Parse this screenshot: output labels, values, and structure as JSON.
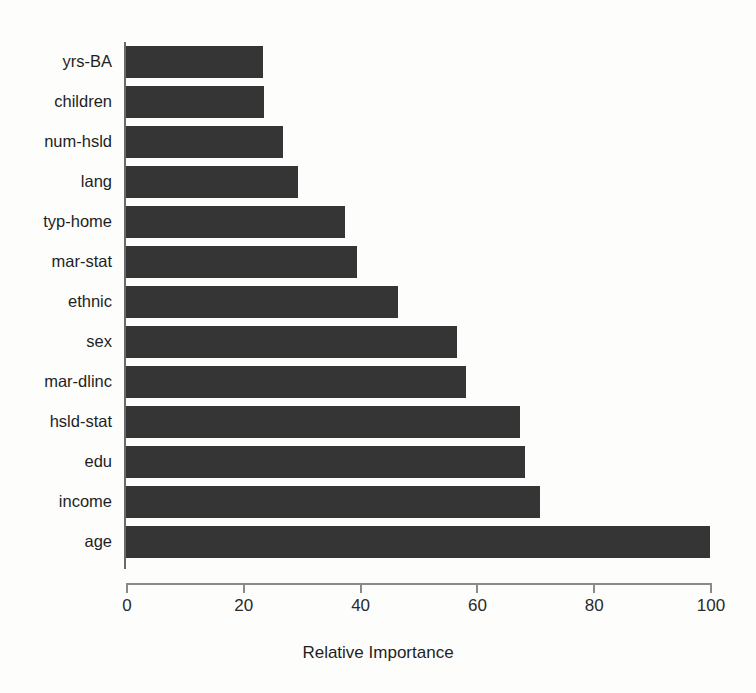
{
  "chart_data": {
    "type": "bar",
    "orientation": "horizontal",
    "title": "",
    "xlabel": "Relative Importance",
    "ylabel": "",
    "xlim": [
      0,
      100
    ],
    "xticks": [
      0,
      20,
      40,
      60,
      80,
      100
    ],
    "xtick_labels": [
      "0",
      "20",
      "40",
      "60",
      "80",
      "100"
    ],
    "grid": false,
    "legend": null,
    "bar_color": "#353535",
    "background_color": "#fdfdfc",
    "axis_color": "#8a8a8a",
    "categories": [
      "yrs-BA",
      "children",
      "num-hsld",
      "lang",
      "typ-home",
      "mar-stat",
      "ethnic",
      "sex",
      "mar-dlinc",
      "hsld-stat",
      "edu",
      "income",
      "age"
    ],
    "values": [
      23.5,
      23.6,
      26.9,
      29.5,
      37.5,
      39.6,
      46.6,
      56.7,
      58.2,
      67.5,
      68.3,
      70.9,
      100.0
    ]
  }
}
